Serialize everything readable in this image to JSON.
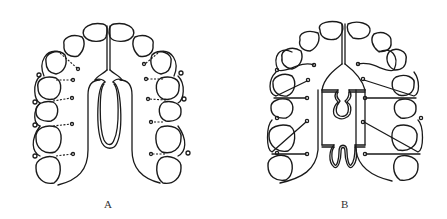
{
  "figures": [
    {
      "id": "A",
      "label": "A",
      "description": "Removable palatal appliance with single U-shaped loop spring and dotted clasp wires on lateral teeth"
    },
    {
      "id": "B",
      "label": "B",
      "description": "Removable palatal appliance with frame, single omega loop and double zigzag loop springs, clasp wires on lateral teeth"
    }
  ],
  "colors": {
    "line": "#1a1a1a",
    "background": "#ffffff",
    "label": "#333333"
  }
}
